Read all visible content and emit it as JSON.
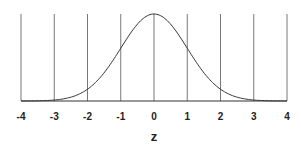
{
  "chart_data": {
    "type": "line",
    "title": "",
    "xlabel": "z",
    "ylabel": "",
    "xlim": [
      -4,
      4
    ],
    "ylim": [
      0,
      0.4
    ],
    "grid": {
      "vertical": true,
      "horizontal": false
    },
    "legend": null,
    "x_ticks": [
      -4,
      -3,
      -2,
      -1,
      0,
      1,
      2,
      3,
      4
    ],
    "x_tick_labels": [
      "-4",
      "-3",
      "-2",
      "-1",
      "0",
      "1",
      "2",
      "3",
      "4"
    ],
    "series": [
      {
        "name": "Standard normal density",
        "x": [
          -4,
          -3.5,
          -3,
          -2.5,
          -2,
          -1.5,
          -1,
          -0.5,
          0,
          0.5,
          1,
          1.5,
          2,
          2.5,
          3,
          3.5,
          4
        ],
        "y": [
          0.0001,
          0.0009,
          0.0044,
          0.0175,
          0.054,
          0.1295,
          0.242,
          0.3521,
          0.3989,
          0.3521,
          0.242,
          0.1295,
          0.054,
          0.0175,
          0.0044,
          0.0009,
          0.0001
        ]
      }
    ]
  },
  "colors": {
    "line": "#333333",
    "grid": "#555555",
    "background": "#ffffff"
  }
}
